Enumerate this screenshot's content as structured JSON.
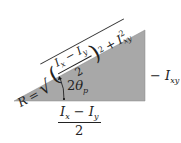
{
  "diagram": {
    "type": "right-triangle",
    "fill_color": "#a8a8a8",
    "vertices": {
      "left": [
        14,
        101
      ],
      "bottom_right": [
        145,
        101
      ],
      "top_right": [
        145,
        30
      ]
    },
    "hypotenuse_label": {
      "lhs": "R",
      "equals": "=",
      "sqrt_numerator": "Ix − Iy",
      "sqrt_numerator_parts": {
        "a": "I",
        "a_sub": "x",
        "minus": "−",
        "b": "I",
        "b_sub": "y"
      },
      "sqrt_denominator": "2",
      "square": "2",
      "plus": "+",
      "term2": "I",
      "term2_sup": "2",
      "term2_sub": "xy"
    },
    "right_side_label": {
      "prefix": "−",
      "var": "I",
      "sub": "xy"
    },
    "bottom_label": {
      "a": "I",
      "a_sub": "x",
      "minus": "−",
      "b": "I",
      "b_sub": "y",
      "denominator": "2"
    },
    "angle_label": {
      "coef": "2",
      "symbol": "θ",
      "sub": "p"
    }
  }
}
